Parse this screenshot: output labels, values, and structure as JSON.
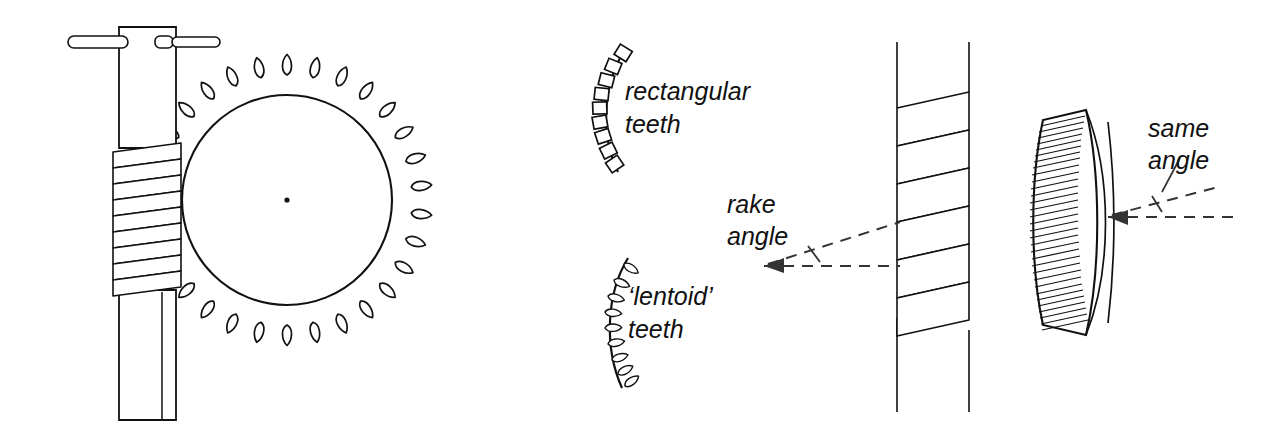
{
  "figure": {
    "background_color": "#ffffff",
    "line_color": "#111111",
    "width": 1264,
    "height": 424
  },
  "labels": {
    "rectangular_teeth": "rectangular\nteeth",
    "rectangular_teeth_line1": "rectangular",
    "rectangular_teeth_line2": "teeth",
    "lentoid_teeth_line1": "‘lentoid’",
    "lentoid_teeth_line2": "teeth",
    "rake_angle_line1": "rake",
    "rake_angle_line2": "angle",
    "same_angle_line1": "same",
    "same_angle_line2": "angle"
  },
  "parts": {
    "worm_wheel_assembly": {
      "name": "worm and wheel assembly",
      "wheel_tooth_count": 30,
      "wheel_center": [
        287,
        200
      ],
      "wheel_radius": 105,
      "worm_thread_count": 9,
      "handle": "tommy bar"
    },
    "rectangular_tooth_arc": {
      "name": "arc of rectangular teeth",
      "tooth_count": 9,
      "tooth_shape": "rectangle"
    },
    "lentoid_tooth_arc": {
      "name": "arc of lentoid teeth",
      "tooth_count": 9,
      "tooth_shape": "lentoid"
    },
    "worm_screw": {
      "name": "worm screw",
      "thread_count": 6
    },
    "helical_gear": {
      "name": "gear rim seen edge on",
      "tooth_count": 34
    }
  },
  "annotations": {
    "rake_angle": {
      "label": "rake angle",
      "style": "dashed angle with arrowhead",
      "points_at": "worm screw flank"
    },
    "same_angle": {
      "label": "same angle",
      "style": "dashed angle with arrowhead",
      "points_at": "gear rim tooth flank"
    }
  }
}
